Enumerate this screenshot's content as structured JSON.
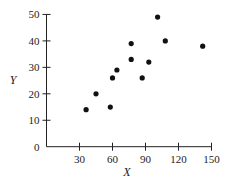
{
  "chart_data": {
    "type": "scatter",
    "title": "",
    "xlabel": "X",
    "ylabel": "Y",
    "xlim": [
      0,
      150
    ],
    "ylim": [
      0,
      50
    ],
    "xticks": [
      30,
      60,
      90,
      120,
      150
    ],
    "yticks": [
      0,
      10,
      20,
      30,
      40,
      50
    ],
    "grid": false,
    "legend": null,
    "series": [
      {
        "name": "data",
        "points": [
          {
            "x": 36,
            "y": 14
          },
          {
            "x": 45,
            "y": 20
          },
          {
            "x": 58,
            "y": 15
          },
          {
            "x": 60,
            "y": 26
          },
          {
            "x": 64,
            "y": 29
          },
          {
            "x": 77,
            "y": 39
          },
          {
            "x": 77,
            "y": 33
          },
          {
            "x": 87,
            "y": 26
          },
          {
            "x": 93,
            "y": 32
          },
          {
            "x": 101,
            "y": 49
          },
          {
            "x": 108,
            "y": 40
          },
          {
            "x": 142,
            "y": 38
          }
        ]
      }
    ]
  },
  "style": {
    "axis_color": "#222222",
    "point_color": "#111111"
  }
}
